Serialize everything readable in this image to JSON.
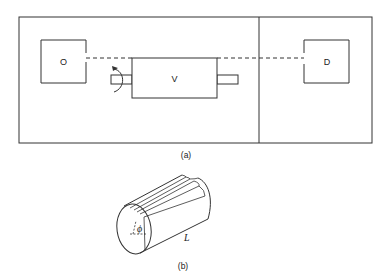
{
  "figure_a": {
    "caption": "(a)",
    "source_label": "O",
    "rotor_label": "V",
    "detector_label": "D",
    "rotation_arrow_icon": "curved-rotation-arrow"
  },
  "figure_b": {
    "caption": "(b)",
    "angle_label": "ϕ",
    "length_label": "L"
  }
}
